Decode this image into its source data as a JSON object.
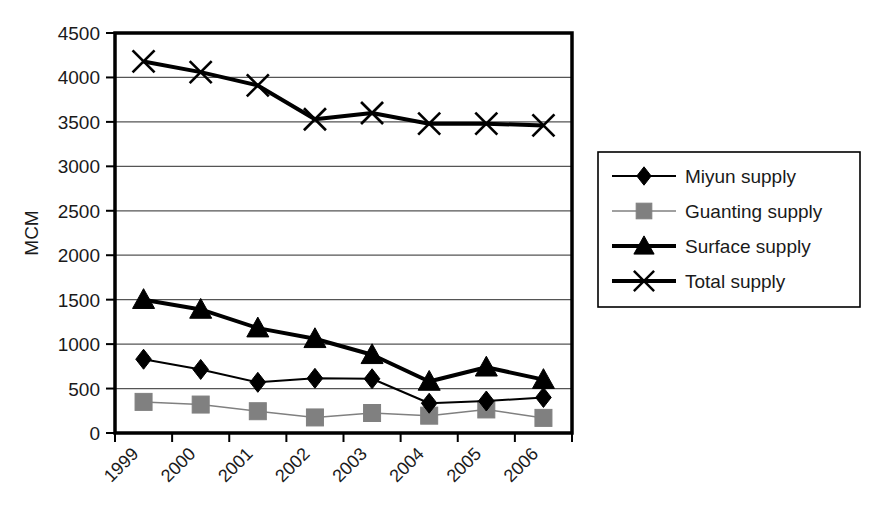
{
  "chart_data": {
    "type": "line",
    "title": "",
    "xlabel": "",
    "ylabel": "MCM",
    "categories": [
      "1999",
      "2000",
      "2001",
      "2002",
      "2003",
      "2004",
      "2005",
      "2006"
    ],
    "ylim": [
      0,
      4500
    ],
    "ytick_step": 500,
    "ytick_labels": [
      "0",
      "500",
      "1000",
      "1500",
      "2000",
      "2500",
      "3000",
      "3500",
      "4000",
      "4500"
    ],
    "grid": "horizontal",
    "legend_position": "right",
    "xtick_label_rotation": "-45",
    "series": [
      {
        "name": "Miyun supply",
        "marker": "diamond",
        "color": "#000000",
        "line_width": 2,
        "values": [
          830,
          715,
          570,
          615,
          610,
          335,
          360,
          400
        ]
      },
      {
        "name": "Guanting supply",
        "marker": "square",
        "color": "#808080",
        "line_width": 1.5,
        "values": [
          350,
          320,
          245,
          175,
          225,
          195,
          265,
          170
        ]
      },
      {
        "name": "Surface supply",
        "marker": "triangle",
        "color": "#000000",
        "line_width": 4,
        "values": [
          1500,
          1390,
          1180,
          1060,
          880,
          580,
          740,
          600
        ]
      },
      {
        "name": "Total supply",
        "marker": "x",
        "color": "#000000",
        "line_width": 4,
        "values": [
          4180,
          4060,
          3910,
          3530,
          3600,
          3480,
          3480,
          3460
        ]
      }
    ]
  },
  "legend": {
    "entries": [
      {
        "label": "Miyun supply"
      },
      {
        "label": "Guanting supply"
      },
      {
        "label": "Surface supply"
      },
      {
        "label": "Total supply"
      }
    ]
  },
  "colors": {
    "axis": "#000000",
    "grid": "#555555",
    "plot_background": "#ffffff",
    "gray_series": "#808080"
  }
}
